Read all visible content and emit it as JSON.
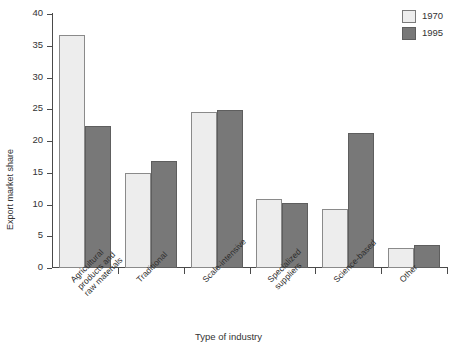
{
  "chart_data": {
    "type": "bar",
    "title": "",
    "xlabel": "Type of industry",
    "ylabel": "Export market share",
    "ylim": [
      0,
      40
    ],
    "yticks": [
      0,
      5,
      10,
      15,
      20,
      25,
      30,
      35,
      40
    ],
    "grid": false,
    "legend_position": "top-right",
    "categories": [
      "Agricultural\nproducts and\nraw materials",
      "Traditional",
      "Scale-intensive",
      "Specialized\nsuppliers",
      "Science-based",
      "Other"
    ],
    "series": [
      {
        "name": "1970",
        "color": "#ededed",
        "values": [
          36.7,
          15.0,
          24.6,
          10.8,
          9.3,
          3.2
        ]
      },
      {
        "name": "1995",
        "color": "#787878",
        "values": [
          22.3,
          16.9,
          24.9,
          10.3,
          21.2,
          3.6
        ]
      }
    ]
  },
  "legend": {
    "items": [
      {
        "label": "1970"
      },
      {
        "label": "1995"
      }
    ]
  },
  "axes": {
    "y_title": "Export market share",
    "x_title": "Type of industry",
    "y_tick_labels": [
      "0",
      "5",
      "10",
      "15",
      "20",
      "25",
      "30",
      "35",
      "40"
    ]
  }
}
